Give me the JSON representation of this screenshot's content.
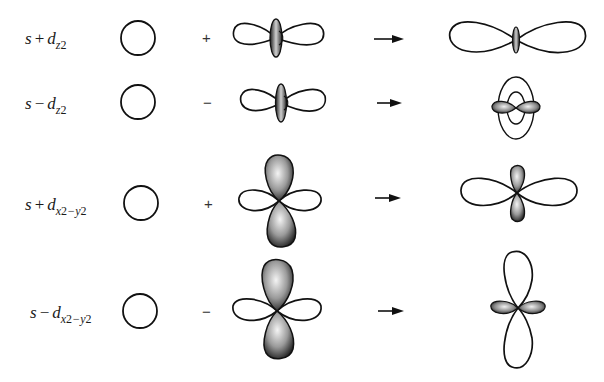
{
  "figure": {
    "stroke_color": "#111111",
    "shade_dark": "#2a2a2a",
    "shade_light": "#f2f2f2",
    "rows": [
      {
        "label": {
          "base": "s",
          "operator": "+",
          "orbital": "d",
          "subscript_parts": [
            "z",
            "2"
          ],
          "text": "s + dz2"
        },
        "operator_sign": "+",
        "s_orbital": "circle",
        "d_orbital": "dz2",
        "result": "elongated dumbbell with small torus"
      },
      {
        "label": {
          "base": "s",
          "operator": "−",
          "orbital": "d",
          "subscript_parts": [
            "z",
            "2"
          ],
          "text": "s − dz2"
        },
        "operator_sign": "−",
        "s_orbital": "circle",
        "d_orbital": "dz2",
        "result": "large torus with small shaded lobes"
      },
      {
        "label": {
          "base": "s",
          "operator": "+",
          "orbital": "d",
          "subscript_parts": [
            "x",
            "2",
            "−y",
            "2"
          ],
          "text": "s + dx2−y2"
        },
        "operator_sign": "+",
        "s_orbital": "circle",
        "d_orbital": "dx2-y2",
        "result": "large horizontal lobes, small shaded vertical lobes"
      },
      {
        "label": {
          "base": "s",
          "operator": "−",
          "orbital": "d",
          "subscript_parts": [
            "x",
            "2",
            "−y",
            "2"
          ],
          "text": "s − dx2−y2"
        },
        "operator_sign": "−",
        "s_orbital": "circle",
        "d_orbital": "dx2-y2",
        "result": "large vertical lobes, small shaded horizontal lobes"
      }
    ],
    "arrow_glyph": "right-arrow"
  }
}
